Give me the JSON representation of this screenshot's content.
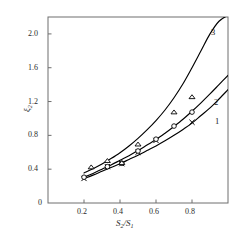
{
  "chart_data": {
    "type": "line",
    "title": "",
    "subtitle": "",
    "xlabel": "S2/S1",
    "xlabel_parts": {
      "base1": "S",
      "sub1": "2",
      "slash": "/",
      "base2": "S",
      "sub2": "1"
    },
    "ylabel": "ξ2",
    "ylabel_parts": {
      "base": "ξ",
      "sub": "2"
    },
    "xlim": [
      0,
      1.0
    ],
    "ylim": [
      0,
      2.2
    ],
    "xticks": [
      0.2,
      0.4,
      0.6,
      0.8
    ],
    "xticklabels": [
      "0.2",
      "0.4",
      "0.6",
      "0.8"
    ],
    "yticks": [
      0,
      0.4,
      0.8,
      1.2,
      1.6,
      2.0
    ],
    "yticklabels": [
      "0",
      "0.4",
      "0.8",
      "1.2",
      "1.6",
      "2.0"
    ],
    "grid": false,
    "legend": "curve-labels-inline",
    "frame": "full-box",
    "series": [
      {
        "name": "1",
        "label": "1",
        "marker": "cross",
        "color": "#000000",
        "curve_x": [
          0.2,
          0.25,
          0.3,
          0.35,
          0.4,
          0.45,
          0.5,
          0.55,
          0.6,
          0.65,
          0.7,
          0.75,
          0.8,
          0.85,
          0.9,
          0.95,
          1.0
        ],
        "curve_y": [
          0.29,
          0.33,
          0.375,
          0.42,
          0.465,
          0.515,
          0.565,
          0.62,
          0.675,
          0.735,
          0.8,
          0.87,
          0.945,
          1.035,
          1.125,
          1.23,
          1.34
        ],
        "points_x": [
          0.2,
          0.33,
          0.41,
          0.5,
          0.6,
          0.8
        ],
        "points_y": [
          0.29,
          0.43,
          0.465,
          0.6,
          0.74,
          0.955
        ]
      },
      {
        "name": "2",
        "label": "2",
        "marker": "circle",
        "color": "#000000",
        "curve_x": [
          0.2,
          0.25,
          0.3,
          0.35,
          0.4,
          0.45,
          0.5,
          0.55,
          0.6,
          0.65,
          0.7,
          0.75,
          0.8,
          0.85,
          0.9,
          0.95,
          1.0
        ],
        "curve_y": [
          0.305,
          0.35,
          0.4,
          0.45,
          0.505,
          0.56,
          0.62,
          0.685,
          0.75,
          0.825,
          0.905,
          0.99,
          1.085,
          1.185,
          1.29,
          1.4,
          1.51
        ],
        "points_x": [
          0.2,
          0.33,
          0.41,
          0.5,
          0.6,
          0.7,
          0.8
        ],
        "points_y": [
          0.305,
          0.43,
          0.47,
          0.615,
          0.755,
          0.91,
          1.075
        ]
      },
      {
        "name": "3",
        "label": "3",
        "marker": "triangle",
        "color": "#000000",
        "curve_x": [
          0.2,
          0.25,
          0.3,
          0.35,
          0.4,
          0.45,
          0.5,
          0.55,
          0.6,
          0.65,
          0.7,
          0.75,
          0.8,
          0.85,
          0.9,
          0.95,
          1.0
        ],
        "curve_y": [
          0.355,
          0.405,
          0.46,
          0.525,
          0.595,
          0.675,
          0.765,
          0.865,
          0.975,
          1.1,
          1.245,
          1.41,
          1.6,
          1.8,
          2.0,
          2.15,
          2.22
        ],
        "points_x": [
          0.24,
          0.33,
          0.41,
          0.5,
          0.7,
          0.8
        ],
        "points_y": [
          0.425,
          0.5,
          0.475,
          0.695,
          1.075,
          1.255
        ]
      }
    ]
  }
}
